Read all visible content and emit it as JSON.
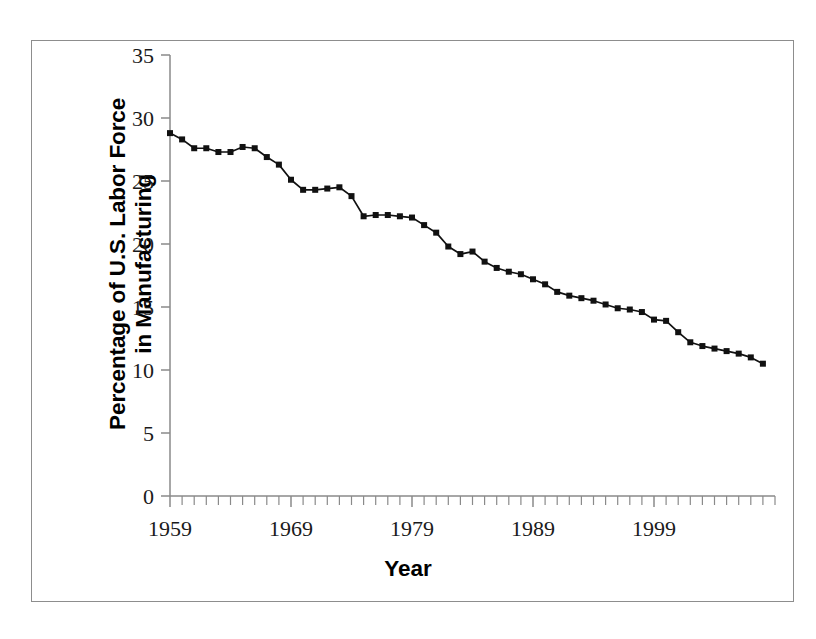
{
  "figure": {
    "background_color": "#ffffff",
    "frame_color": "#8d8d8d"
  },
  "axis_titles": {
    "y": "Percentage of U.S. Labor Force\nin Manufacturing",
    "x": "Year"
  },
  "chart_data": {
    "type": "line",
    "title": "",
    "subtitle": "",
    "xlabel": "Year",
    "ylabel": "Percentage of U.S. Labor Force in Manufacturing",
    "xlim": [
      1959,
      2009
    ],
    "ylim": [
      0,
      35
    ],
    "ytick_labels": [
      "0",
      "5",
      "10",
      "15",
      "20",
      "25",
      "30",
      "35"
    ],
    "ytick_values": [
      0,
      5,
      10,
      15,
      20,
      25,
      30,
      35
    ],
    "xtick_labels": [
      "1959",
      "1969",
      "1979",
      "1989",
      "1999"
    ],
    "xtick_values": [
      1959,
      1969,
      1979,
      1989,
      1999
    ],
    "x_minor_tick_step": 1,
    "grid": false,
    "legend": null,
    "legend_position": "none",
    "marker": "square",
    "line_color": "#111111",
    "marker_color": "#111111",
    "series": [
      {
        "name": "Percentage of U.S. Labor Force in Manufacturing",
        "x": [
          1959,
          1960,
          1961,
          1962,
          1963,
          1964,
          1965,
          1966,
          1967,
          1968,
          1969,
          1970,
          1971,
          1972,
          1973,
          1974,
          1975,
          1976,
          1977,
          1978,
          1979,
          1980,
          1981,
          1982,
          1983,
          1984,
          1985,
          1986,
          1987,
          1988,
          1989,
          1990,
          1991,
          1992,
          1993,
          1994,
          1995,
          1996,
          1997,
          1998,
          1999,
          2000,
          2001,
          2002,
          2003,
          2004,
          2005,
          2006,
          2007,
          2008
        ],
        "values": [
          28.8,
          28.3,
          27.6,
          27.6,
          27.3,
          27.3,
          27.7,
          27.6,
          26.9,
          26.3,
          25.1,
          24.3,
          24.3,
          24.4,
          24.5,
          23.8,
          22.2,
          22.3,
          22.3,
          22.2,
          22.1,
          21.5,
          20.9,
          19.8,
          19.2,
          19.4,
          18.6,
          18.1,
          17.8,
          17.6,
          17.2,
          16.8,
          16.2,
          15.9,
          15.7,
          15.5,
          15.2,
          14.9,
          14.8,
          14.6,
          14.0,
          13.9,
          13.0,
          12.2,
          11.9,
          11.7,
          11.5,
          11.3,
          11.0,
          10.5
        ]
      }
    ]
  }
}
